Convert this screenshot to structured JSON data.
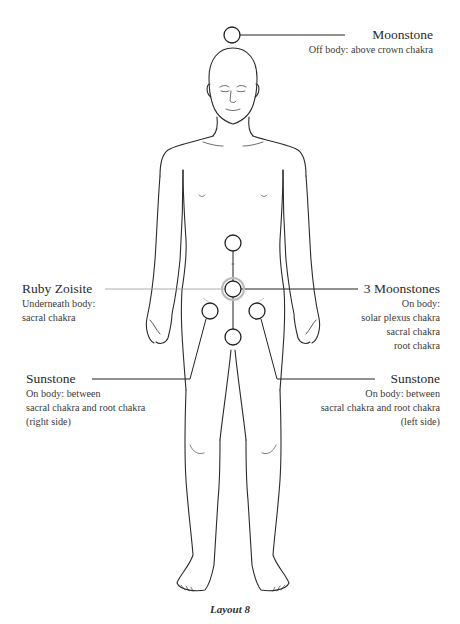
{
  "diagram": {
    "type": "crystal-layout-body-diagram",
    "caption": "Layout 8",
    "colors": {
      "line": "#222222",
      "body_outline": "#2b2b2b",
      "ruby_halo": "#bbbbbb",
      "text": "#333333"
    },
    "labels": {
      "moonstone": {
        "name": "Moonstone",
        "lines": [
          "Off body: above crown chakra"
        ]
      },
      "ruby_zoisite": {
        "name": "Ruby Zoisite",
        "lines": [
          "Underneath body:",
          "sacral chakra"
        ]
      },
      "three_moonstones": {
        "name": "3 Moonstones",
        "lines": [
          "On body:",
          "solar plexus chakra",
          "sacral chakra",
          "root chakra"
        ]
      },
      "sunstone_right": {
        "name": "Sunstone",
        "lines": [
          "On body: between",
          "sacral chakra and root chakra",
          "(right side)"
        ]
      },
      "sunstone_left": {
        "name": "Sunstone",
        "lines": [
          "On body: between",
          "sacral chakra and root chakra",
          "(left side)"
        ]
      }
    },
    "stones": [
      {
        "id": "moonstone-crown",
        "cx": 232,
        "cy": 35,
        "r": 8
      },
      {
        "id": "moonstone-solar-plexus",
        "cx": 233,
        "cy": 243,
        "r": 8
      },
      {
        "id": "moonstone-sacral",
        "cx": 233,
        "cy": 289,
        "r": 8
      },
      {
        "id": "moonstone-root",
        "cx": 233,
        "cy": 337,
        "r": 8
      },
      {
        "id": "sunstone-right",
        "cx": 210,
        "cy": 311,
        "r": 8
      },
      {
        "id": "sunstone-left",
        "cx": 257,
        "cy": 311,
        "r": 8
      }
    ]
  }
}
